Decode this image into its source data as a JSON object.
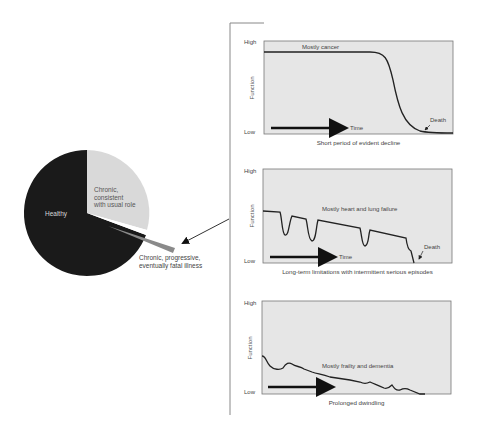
{
  "pie": {
    "slices": [
      {
        "label": "Healthy",
        "color": "#1a1a1a",
        "text_color": "#d8d8d8",
        "approx_share": 0.69
      },
      {
        "label_lines": [
          "Chronic,",
          "consistent",
          "with usual role"
        ],
        "color": "#d9d9d9",
        "text_color": "#555555",
        "approx_share": 0.3
      },
      {
        "label_lines": [
          "Chronic, progressive,",
          "eventually fatal illness"
        ],
        "color": "#8a8a8a",
        "text_color": "#444444",
        "approx_share": 0.01,
        "exploded": true
      }
    ]
  },
  "charts": [
    {
      "id": "cancer",
      "y_high": "High",
      "y_low": "Low",
      "y_axis_label": "Function",
      "series_label": "Mostly cancer",
      "time_label": "Time",
      "death_label": "Death",
      "caption": "Short period of evident decline"
    },
    {
      "id": "organ-failure",
      "y_high": "High",
      "y_low": "Low",
      "y_axis_label": "Function",
      "series_label": "Mostly heart and lung failure",
      "time_label": "Time",
      "death_label": "Death",
      "caption": "Long-term limitations with intermittent serious episodes"
    },
    {
      "id": "frailty",
      "y_high": "High",
      "y_low": "Low",
      "y_axis_label": "Function",
      "series_label": "Mostly frailty and dementia",
      "caption": "Prolonged dwindling"
    }
  ],
  "colors": {
    "plot_bg": "#e6e6e6",
    "plot_border": "#777777",
    "curve": "#222222",
    "bracket": "#888888"
  }
}
